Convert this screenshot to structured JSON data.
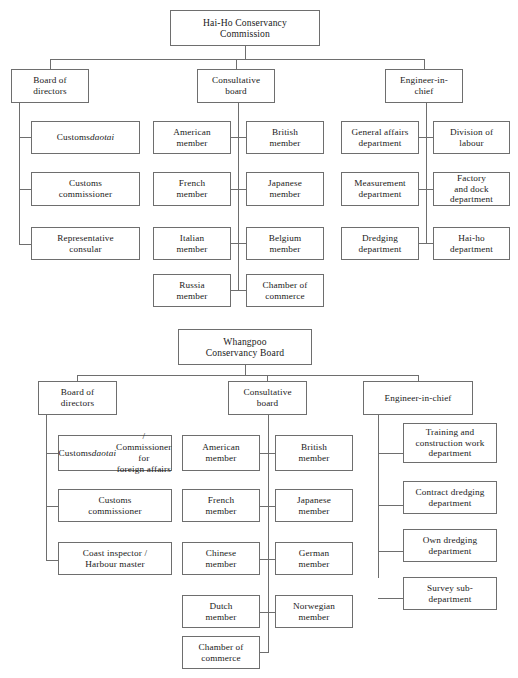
{
  "diagram": {
    "title_hint": "Organisational charts of the Hai-Ho Conservancy Commission and the Whangpoo Conservancy Board",
    "line_color": "#6e6e6e",
    "background": "#ffffff",
    "text_color": "#1a1a1a"
  },
  "charts": [
    {
      "id": "hai-ho",
      "root": {
        "label": "Hai-Ho Conservancy\nCommission"
      },
      "branches": [
        {
          "id": "board-of-directors",
          "label": "Board of\ndirectors",
          "children": [
            {
              "label": "Customs daotai",
              "italic_part": "daotai"
            },
            {
              "label": "Customs\ncommissioner"
            },
            {
              "label": "Representative\nconsular"
            }
          ]
        },
        {
          "id": "consultative-board",
          "label": "Consultative\nboard",
          "children_left": [
            {
              "label": "American\nmember"
            },
            {
              "label": "French\nmember"
            },
            {
              "label": "Italian\nmember"
            },
            {
              "label": "Russia\nmember"
            }
          ],
          "children_right": [
            {
              "label": "British\nmember"
            },
            {
              "label": "Japanese\nmember"
            },
            {
              "label": "Belgium\nmember"
            },
            {
              "label": "Chamber of\ncommerce"
            }
          ]
        },
        {
          "id": "engineer-in-chief",
          "label": "Engineer-in-\nchief",
          "children_left": [
            {
              "label": "General affairs\ndepartment"
            },
            {
              "label": "Measurement\ndepartment"
            },
            {
              "label": "Dredging\ndepartment"
            }
          ],
          "children_right": [
            {
              "label": "Division of\nlabour"
            },
            {
              "label": "Factory\nand dock\ndepartment"
            },
            {
              "label": "Hai-ho\ndepartment"
            }
          ]
        }
      ]
    },
    {
      "id": "whangpoo",
      "root": {
        "label": "Whangpoo\nConservancy Board"
      },
      "branches": [
        {
          "id": "board-of-directors",
          "label": "Board of\ndirectors",
          "children": [
            {
              "label": "Customs daotai /\nCommissioner for\nforeign affairs",
              "italic_part": "daotai"
            },
            {
              "label": "Customs\ncommissioner"
            },
            {
              "label": "Coast inspector /\nHarbour master"
            }
          ]
        },
        {
          "id": "consultative-board",
          "label": "Consultative\nboard",
          "children_left": [
            {
              "label": "American\nmember"
            },
            {
              "label": "French\nmember"
            },
            {
              "label": "Chinese\nmember"
            },
            {
              "label": "Dutch\nmember"
            },
            {
              "label": "Chamber of\ncommerce"
            }
          ],
          "children_right": [
            {
              "label": "British\nmember"
            },
            {
              "label": "Japanese\nmember"
            },
            {
              "label": "German\nmember"
            },
            {
              "label": "Norwegian\nmember"
            }
          ]
        },
        {
          "id": "engineer-in-chief",
          "label": "Engineer-in-chief",
          "children": [
            {
              "label": "Training and\nconstruction work\ndepartment"
            },
            {
              "label": "Contract dredging\ndepartment"
            },
            {
              "label": "Own dredging\ndepartment"
            },
            {
              "label": "Survey sub-\ndepartment"
            }
          ]
        }
      ]
    }
  ]
}
